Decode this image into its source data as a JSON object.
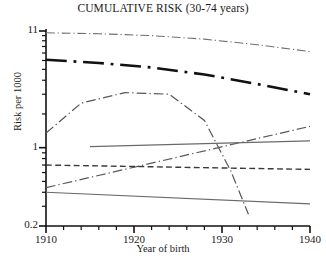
{
  "chart_data": {
    "type": "line",
    "title": "CUMULATIVE RISK (30-74 years)",
    "xlabel": "Year of birth",
    "ylabel": "Risk per 1000",
    "xlim": [
      1910,
      1940
    ],
    "ylim": [
      0.2,
      11
    ],
    "yscale": "log",
    "grid": false,
    "legend": "none",
    "xticks": [
      1910,
      1920,
      1930,
      1940
    ],
    "xtick_labels": [
      "1910",
      "1920",
      "1930",
      "1940"
    ],
    "xminor_step": 2,
    "yticks": [
      0.2,
      1,
      11
    ],
    "ytick_labels": [
      "0.2",
      "1",
      "11"
    ],
    "series": [
      {
        "name": "top-thin-dashdot",
        "style": "dashdot",
        "width": 1.1,
        "color": "#6f6f6f",
        "x": [
          1910,
          1916,
          1922,
          1928,
          1934,
          1940
        ],
        "values": [
          10.6,
          10.4,
          10.0,
          9.3,
          8.3,
          7.2
        ]
      },
      {
        "name": "upper-thick-dashdot",
        "style": "dashdot",
        "width": 2.6,
        "color": "#111111",
        "x": [
          1910,
          1916,
          1922,
          1928,
          1934,
          1940
        ],
        "values": [
          6.1,
          5.7,
          5.2,
          4.5,
          3.7,
          3.0
        ]
      },
      {
        "name": "hump-dashdot",
        "style": "dashdot",
        "width": 1.2,
        "color": "#555555",
        "x": [
          1910,
          1914,
          1919,
          1924,
          1928,
          1931,
          1933
        ],
        "values": [
          1.35,
          2.5,
          3.1,
          3.0,
          1.75,
          0.62,
          0.255
        ]
      },
      {
        "name": "rising-dashdot",
        "style": "dashdot",
        "width": 1.2,
        "color": "#5a5a5a",
        "x": [
          1910,
          1940
        ],
        "values": [
          0.44,
          1.55
        ]
      },
      {
        "name": "flat-solid-upper",
        "style": "solid",
        "width": 1.2,
        "color": "#6a6a6a",
        "x": [
          1915,
          1940
        ],
        "values": [
          1.02,
          1.15
        ]
      },
      {
        "name": "flat-dashed",
        "style": "dashed",
        "width": 1.4,
        "color": "#3a3a3a",
        "x": [
          1910,
          1940
        ],
        "values": [
          0.7,
          0.64
        ]
      },
      {
        "name": "flat-solid-lower",
        "style": "solid",
        "width": 1.2,
        "color": "#6a6a6a",
        "x": [
          1910,
          1940
        ],
        "values": [
          0.4,
          0.315
        ]
      }
    ]
  }
}
